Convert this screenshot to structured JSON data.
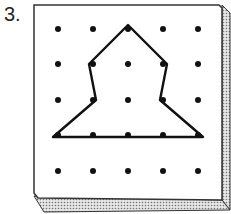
{
  "problem": {
    "number_label": "3."
  },
  "geoboard": {
    "rows": 5,
    "cols": 5,
    "peg_x": [
      58,
      93,
      128,
      163,
      198
    ],
    "peg_y": [
      29,
      64,
      100,
      135,
      171
    ],
    "board_color": "#ffffff",
    "edge_color": "#333333",
    "peg_color": "#111111",
    "band_color": "#111111"
  },
  "shape": {
    "description": "rubber band polygon around pegs",
    "vertices_grid": [
      [
        2,
        0
      ],
      [
        3,
        1
      ],
      [
        3,
        2
      ],
      [
        4,
        3
      ],
      [
        0,
        3
      ],
      [
        1,
        2
      ],
      [
        1,
        1
      ]
    ]
  }
}
